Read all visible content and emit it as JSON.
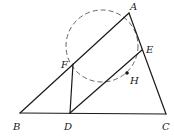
{
  "diagram": {
    "type": "geometry",
    "points": {
      "A": {
        "label": "A",
        "x": 129,
        "y": 13,
        "lx": 130,
        "ly": 10
      },
      "B": {
        "label": "B",
        "x": 20,
        "y": 113,
        "lx": 13,
        "ly": 130
      },
      "C": {
        "label": "C",
        "x": 166,
        "y": 114,
        "lx": 162,
        "ly": 130
      },
      "D": {
        "label": "D",
        "x": 70,
        "y": 113,
        "lx": 64,
        "ly": 130
      },
      "E": {
        "label": "E",
        "x": 142,
        "y": 50,
        "lx": 146,
        "ly": 53
      },
      "F": {
        "label": "F",
        "x": 73,
        "y": 64,
        "lx": 61,
        "ly": 68
      },
      "H": {
        "label": "H",
        "x": 127,
        "y": 73,
        "lx": 130,
        "ly": 84
      }
    },
    "segments": [
      [
        "A",
        "B"
      ],
      [
        "A",
        "C"
      ],
      [
        "B",
        "C"
      ],
      [
        "F",
        "D"
      ],
      [
        "D",
        "E"
      ]
    ],
    "circle": {
      "cx": 102,
      "cy": 46,
      "r": 36,
      "style": "dashed",
      "through": [
        "A",
        "F",
        "E"
      ]
    }
  }
}
